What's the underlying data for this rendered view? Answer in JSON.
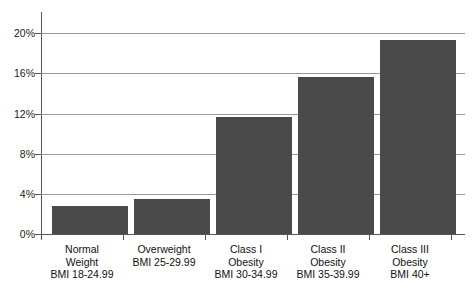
{
  "chart_data": {
    "type": "bar",
    "title": "",
    "subtitle": "",
    "xlabel": "",
    "ylabel": "",
    "ylim": [
      0,
      20
    ],
    "ytick_values": [
      0,
      4,
      8,
      12,
      16,
      20
    ],
    "ytick_labels": [
      "0%",
      "4%",
      "8%",
      "12%",
      "16%",
      "20%"
    ],
    "grid": true,
    "legend": "none",
    "bar_color": "#4a4a4a",
    "gridline_color": "#999999",
    "axis_color": "#555555",
    "categories": [
      "Normal Weight BMI 18-24.99",
      "Overweight BMI 25-29.99",
      "Class I Obesity BMI 30-34.99",
      "Class II Obesity BMI 35-39.99",
      "Class III Obesity BMI 40+"
    ],
    "category_label_lines": [
      [
        "Normal",
        "Weight",
        "BMI 18-24.99"
      ],
      [
        "Overweight",
        "BMI 25-29.99",
        ""
      ],
      [
        "Class I",
        "Obesity",
        "BMI 30-34.99"
      ],
      [
        "Class II",
        "Obesity",
        "BMI 35-39.99"
      ],
      [
        "Class III",
        "Obesity",
        "BMI 40+"
      ]
    ],
    "values": [
      2.8,
      3.5,
      11.6,
      15.6,
      19.3
    ],
    "value_unit": "%"
  },
  "yaxis": {
    "t0": "0%",
    "t1": "4%",
    "t2": "8%",
    "t3": "12%",
    "t4": "16%",
    "t5": "20%"
  },
  "categories": {
    "c0": {
      "l0": "Normal",
      "l1": "Weight",
      "l2": "BMI 18-24.99"
    },
    "c1": {
      "l0": "Overweight",
      "l1": "BMI 25-29.99",
      "l2": ""
    },
    "c2": {
      "l0": "Class I",
      "l1": "Obesity",
      "l2": "BMI 30-34.99"
    },
    "c3": {
      "l0": "Class II",
      "l1": "Obesity",
      "l2": "BMI 35-39.99"
    },
    "c4": {
      "l0": "Class III",
      "l1": "Obesity",
      "l2": "BMI 40+"
    }
  }
}
